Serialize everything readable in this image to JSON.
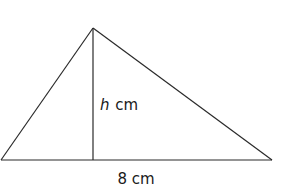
{
  "diagram": {
    "type": "triangle",
    "vertices": {
      "apex": [
        93,
        28
      ],
      "bottom_left": [
        1,
        160
      ],
      "bottom_right": [
        272,
        160
      ]
    },
    "height_line": {
      "from": [
        93,
        28
      ],
      "to": [
        93,
        160
      ]
    },
    "labels": {
      "height_variable": "h",
      "height_unit": "cm",
      "base": "8 cm"
    },
    "stroke_color": "#2a2a2a",
    "text_color": "#1a1a1a"
  }
}
